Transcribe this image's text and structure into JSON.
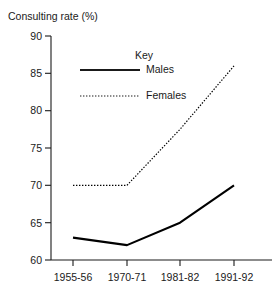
{
  "chart_data": {
    "type": "line",
    "title": "Consulting rate (%)",
    "xlabel": "",
    "ylabel": "Consulting rate (%)",
    "categories": [
      "1955-56",
      "1970-71",
      "1981-82",
      "1991-92"
    ],
    "series": [
      {
        "name": "Males",
        "style": "solid",
        "color": "#000000",
        "values": [
          63,
          62,
          65,
          70
        ]
      },
      {
        "name": "Females",
        "style": "dotted",
        "color": "#000000",
        "values": [
          70,
          70,
          77.5,
          86
        ]
      }
    ],
    "ylim": [
      60,
      90
    ],
    "yticks": [
      60,
      65,
      70,
      75,
      80,
      85,
      90
    ],
    "ytick_labels": [
      "60",
      "65",
      "70",
      "75",
      "80",
      "85",
      "90"
    ],
    "grid": false,
    "legend": {
      "title": "Key",
      "position": "inside-top-center",
      "entries": [
        {
          "label": "Males",
          "style": "solid"
        },
        {
          "label": "Females",
          "style": "dotted"
        }
      ]
    }
  },
  "axis": {
    "title": "Consulting rate (%)"
  }
}
